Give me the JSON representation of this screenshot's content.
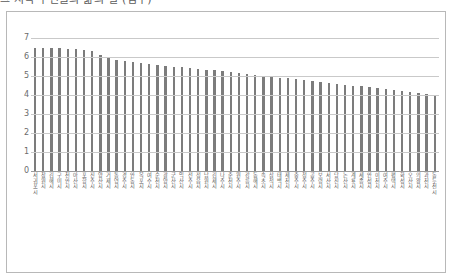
{
  "title_clipped": "그 지역 주민들의 삶의 질 (점수)",
  "chart_data": {
    "type": "bar",
    "title": "그 지역 주민들의 삶의 질 (점수)",
    "xlabel": "",
    "ylabel": "",
    "ylim": [
      0,
      7
    ],
    "yticks": [
      0,
      1,
      2,
      3,
      4,
      5,
      6,
      7
    ],
    "grid": true,
    "legend": "none",
    "bar_color": "#7c7c7c",
    "gridline_color": "#c9c9c9",
    "categories": [
      "서귀포시",
      "창원시",
      "김해시",
      "구미시",
      "천안시",
      "아산시",
      "포항시",
      "진주시",
      "양산시",
      "거제시",
      "통영시",
      "경주시",
      "안동시",
      "목포시",
      "여수시",
      "순천시",
      "광양시",
      "군산시",
      "익산시",
      "전주시",
      "정읍시",
      "남원시",
      "김제시",
      "나주시",
      "춘천시",
      "원주시",
      "강릉시",
      "동해시",
      "속초시",
      "삼척시",
      "태백시",
      "제천시",
      "충주시",
      "청주시",
      "공주시",
      "보령시",
      "서산시",
      "당진시",
      "논산시",
      "계룡시",
      "세종시",
      "안성시",
      "이천시",
      "여주시",
      "평택시",
      "화성시",
      "오산시",
      "의왕시",
      "과천시",
      "동두천시"
    ],
    "values": [
      6.5,
      6.5,
      6.5,
      6.45,
      6.4,
      6.4,
      6.35,
      6.3,
      6.1,
      5.95,
      5.85,
      5.8,
      5.75,
      5.7,
      5.65,
      5.6,
      5.55,
      5.5,
      5.45,
      5.4,
      5.35,
      5.3,
      5.3,
      5.25,
      5.2,
      5.15,
      5.1,
      5.05,
      5.0,
      4.95,
      4.9,
      4.9,
      4.85,
      4.8,
      4.75,
      4.7,
      4.65,
      4.6,
      4.55,
      4.5,
      4.45,
      4.4,
      4.35,
      4.3,
      4.25,
      4.2,
      4.15,
      4.1,
      4.05,
      4.0
    ]
  }
}
